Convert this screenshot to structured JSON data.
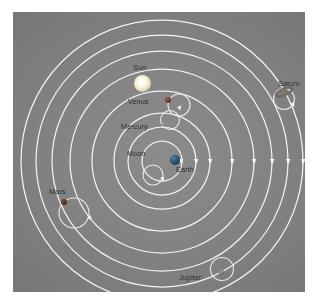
{
  "diagram": {
    "background_color": "#848484",
    "orbit_line_color": "#f2f2f2",
    "label_color": "#1d1d1d",
    "center_body": "Earth",
    "labels": {
      "sun": "Sun",
      "venus": "Venus",
      "mercury": "Mercury",
      "moon": "Moon",
      "earth": "Earth",
      "mars": "Mars",
      "saturn": "Saturn",
      "jupiter": "Jupiter"
    },
    "bodies": [
      {
        "name": "Sun",
        "label": "Sun",
        "color": "#fdf8e0",
        "kind": "star",
        "has_epicycle": false
      },
      {
        "name": "Venus",
        "label": "Venus",
        "color": "#6e3a2c",
        "kind": "planet",
        "has_epicycle": true
      },
      {
        "name": "Mercury",
        "label": "Mercury",
        "color": "#8d8a82",
        "kind": "planet",
        "has_epicycle": true
      },
      {
        "name": "Moon",
        "label": "Moon",
        "color": "#d8d4c8",
        "kind": "moon",
        "has_epicycle": true
      },
      {
        "name": "Earth",
        "label": "Earth",
        "color": "#35566f",
        "kind": "planet",
        "has_epicycle": false
      },
      {
        "name": "Mars",
        "label": "Mars",
        "color": "#5d2c20",
        "kind": "planet",
        "has_epicycle": true
      },
      {
        "name": "Jupiter",
        "label": "Jupiter",
        "color": "#7c766c",
        "kind": "planet",
        "has_epicycle": true
      },
      {
        "name": "Saturn",
        "label": "Saturn",
        "color": "#8a8274",
        "kind": "planet",
        "has_epicycle": true
      }
    ],
    "deferent_count": 8,
    "direction_markers": "arrowheads on each orbit"
  }
}
